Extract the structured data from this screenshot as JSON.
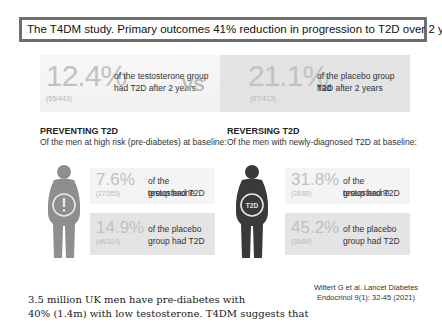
{
  "title": "The T4DM study. Primary outcomes  41% reduction in progression to T2D over 2 years",
  "primary": {
    "testosterone": {
      "pct": "12.4%",
      "n": "(55/443)",
      "desc_line1": "of the testosterone group",
      "desc_line2": "had T2D after 2 years"
    },
    "vs": "VS",
    "placebo": {
      "pct": "21.1%",
      "n": "(87/413)",
      "desc_line1": "of the placebo group had",
      "desc_line2": "T2D after 2 years"
    }
  },
  "preventing": {
    "title": "PREVENTING T2D",
    "subtitle": "Of the men at high risk (pre-diabetes) at baseline:",
    "icon_label": "!",
    "testosterone": {
      "pct": "7.6%",
      "n": "(27/355)",
      "line1": "of the testosterone",
      "line2": "group had T2D"
    },
    "placebo": {
      "pct": "14.9%",
      "n": "(46/329)",
      "line1": "of the placebo",
      "line2": "group had T2D"
    }
  },
  "reversing": {
    "title": "REVERSING T2D",
    "subtitle": "Of the men with newly-diagnosed T2D at baseline:",
    "icon_label": "T2D",
    "testosterone": {
      "pct": "31.8%",
      "n": "(28/88)",
      "line1": "of the testosterone",
      "line2": "group had T2D"
    },
    "placebo": {
      "pct": "45.2%",
      "n": "(38/84)",
      "line1": "of the placebo",
      "line2": "group had T2D"
    }
  },
  "citation": {
    "line1": "Wittert G et al. Lancet Diabetes",
    "line2": "Endocrinol 9(1): 32-45 (2021)"
  },
  "bottom_text": {
    "line1": "3.5 million UK men have pre-diabetes with",
    "line2": "40% (1.4m) with low testosterone. T4DM suggests that"
  },
  "colors": {
    "light_figure": "#8e8e8e",
    "dark_figure": "#3a3a3a",
    "title_border": "#6f6f6f"
  }
}
